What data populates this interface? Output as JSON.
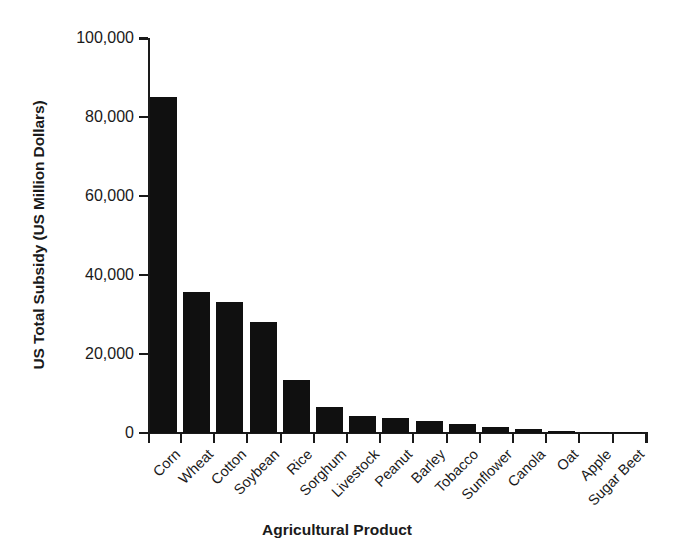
{
  "chart_data": {
    "type": "bar",
    "title": "",
    "xlabel": "Agricultural Product",
    "ylabel": "US Total Subsidy (US Million Dollars)",
    "ylim": [
      0,
      100000
    ],
    "yticks": [
      0,
      20000,
      40000,
      60000,
      80000,
      100000
    ],
    "ytick_labels": [
      "0",
      "20,000",
      "40,000",
      "60,000",
      "80,000",
      "100,000"
    ],
    "grid": false,
    "legend": null,
    "bar_color": "#101010",
    "categories": [
      "Corn",
      "Wheat",
      "Cotton",
      "Soybean",
      "Rice",
      "Sorghum",
      "Livestock",
      "Peanut",
      "Barley",
      "Tobacco",
      "Sunflower",
      "Canola",
      "Oat",
      "Apple",
      "Sugar Beet"
    ],
    "values": [
      85000,
      35700,
      33100,
      28000,
      13400,
      6500,
      4200,
      3700,
      3100,
      2300,
      1500,
      1000,
      550,
      300,
      200
    ]
  }
}
